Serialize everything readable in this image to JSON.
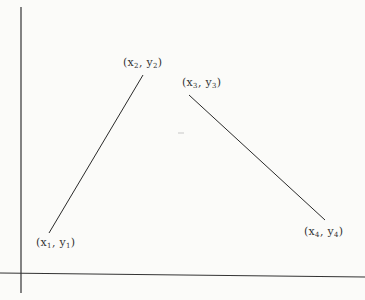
{
  "diagram": {
    "axes": {
      "y_axis": {
        "x": 21,
        "y_top": 7,
        "y_bottom": 293
      },
      "x_axis": {
        "y_left": 273,
        "y_right": 277,
        "x_left": 0,
        "x_right": 365
      }
    },
    "segments": [
      {
        "from": "p1",
        "to": "p2",
        "x1": 49,
        "y1": 233,
        "x2": 143,
        "y2": 75
      },
      {
        "from": "p3",
        "to": "p4",
        "x1": 189,
        "y1": 95,
        "x2": 325,
        "y2": 220
      }
    ],
    "points": [
      {
        "id": "p1",
        "var_x": "x",
        "sub_x": "1",
        "var_y": "y",
        "sub_y": "1",
        "label": "(x1, y1)"
      },
      {
        "id": "p2",
        "var_x": "x",
        "sub_x": "2",
        "var_y": "y",
        "sub_y": "2",
        "label": "(x2, y2)"
      },
      {
        "id": "p3",
        "var_x": "x",
        "sub_x": "3",
        "var_y": "y",
        "sub_y": "3",
        "label": "(x3, y3)"
      },
      {
        "id": "p4",
        "var_x": "x",
        "sub_x": "4",
        "var_y": "y",
        "sub_y": "4",
        "label": "(x4, y4)"
      }
    ],
    "colors": {
      "line": "#2a2a2a",
      "background": "#fbfbf9",
      "text": "#333333"
    }
  }
}
